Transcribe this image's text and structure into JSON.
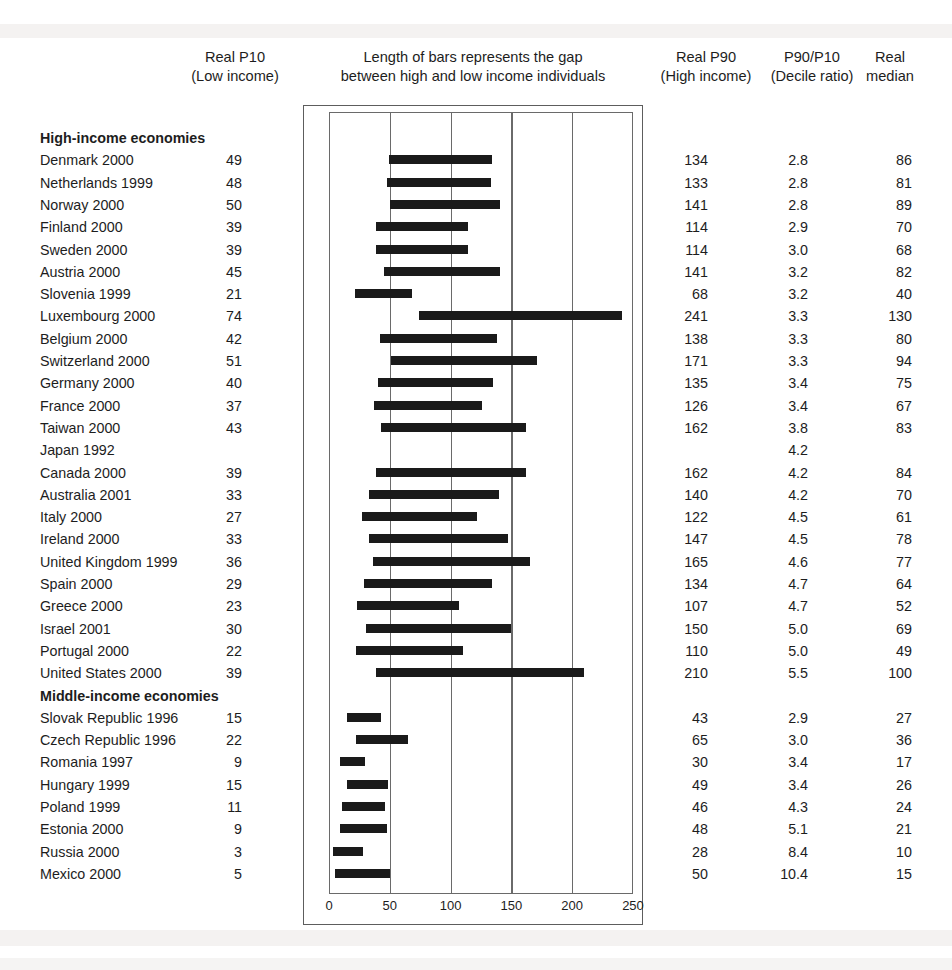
{
  "header": {
    "p10_line1": "Real P10",
    "p10_line2": "(Low income)",
    "chart_line1": "Length of bars represents the gap",
    "chart_line2": "between high and low income individuals",
    "p90_line1": "Real P90",
    "p90_line2": "(High income)",
    "ratio_line1": "P90/P10",
    "ratio_line2": "(Decile ratio)",
    "median_line1": "Real",
    "median_line2": "median"
  },
  "chart_data": {
    "type": "bar",
    "orientation": "horizontal",
    "title": "Length of bars represents the gap between high and low income individuals",
    "xlabel": "",
    "ylabel": "",
    "xlim": [
      0,
      250
    ],
    "xticks": [
      0,
      50,
      100,
      150,
      200,
      250
    ],
    "gridlines": [
      50,
      100,
      150,
      200
    ],
    "grid": true,
    "legend": false,
    "bar_start_field": "p10",
    "bar_end_field": "p90",
    "columns": [
      "Country and year",
      "Real P10",
      "Real P90",
      "P90/P10",
      "Real median"
    ],
    "groups": [
      {
        "label": "High-income economies",
        "rows": [
          {
            "label": "Denmark 2000",
            "p10": 49,
            "p90": 134,
            "ratio": "2.8",
            "median": 86
          },
          {
            "label": "Netherlands 1999",
            "p10": 48,
            "p90": 133,
            "ratio": "2.8",
            "median": 81
          },
          {
            "label": "Norway 2000",
            "p10": 50,
            "p90": 141,
            "ratio": "2.8",
            "median": 89
          },
          {
            "label": "Finland 2000",
            "p10": 39,
            "p90": 114,
            "ratio": "2.9",
            "median": 70
          },
          {
            "label": "Sweden 2000",
            "p10": 39,
            "p90": 114,
            "ratio": "3.0",
            "median": 68
          },
          {
            "label": "Austria 2000",
            "p10": 45,
            "p90": 141,
            "ratio": "3.2",
            "median": 82
          },
          {
            "label": "Slovenia 1999",
            "p10": 21,
            "p90": 68,
            "ratio": "3.2",
            "median": 40
          },
          {
            "label": "Luxembourg 2000",
            "p10": 74,
            "p90": 241,
            "ratio": "3.3",
            "median": 130
          },
          {
            "label": "Belgium 2000",
            "p10": 42,
            "p90": 138,
            "ratio": "3.3",
            "median": 80
          },
          {
            "label": "Switzerland 2000",
            "p10": 51,
            "p90": 171,
            "ratio": "3.3",
            "median": 94
          },
          {
            "label": "Germany 2000",
            "p10": 40,
            "p90": 135,
            "ratio": "3.4",
            "median": 75
          },
          {
            "label": "France 2000",
            "p10": 37,
            "p90": 126,
            "ratio": "3.4",
            "median": 67
          },
          {
            "label": "Taiwan 2000",
            "p10": 43,
            "p90": 162,
            "ratio": "3.8",
            "median": 83
          },
          {
            "label": "Japan 1992",
            "p10": null,
            "p90": null,
            "ratio": "4.2",
            "median": null
          },
          {
            "label": "Canada 2000",
            "p10": 39,
            "p90": 162,
            "ratio": "4.2",
            "median": 84
          },
          {
            "label": "Australia 2001",
            "p10": 33,
            "p90": 140,
            "ratio": "4.2",
            "median": 70
          },
          {
            "label": "Italy 2000",
            "p10": 27,
            "p90": 122,
            "ratio": "4.5",
            "median": 61
          },
          {
            "label": "Ireland 2000",
            "p10": 33,
            "p90": 147,
            "ratio": "4.5",
            "median": 78
          },
          {
            "label": "United Kingdom 1999",
            "p10": 36,
            "p90": 165,
            "ratio": "4.6",
            "median": 77
          },
          {
            "label": "Spain 2000",
            "p10": 29,
            "p90": 134,
            "ratio": "4.7",
            "median": 64
          },
          {
            "label": "Greece 2000",
            "p10": 23,
            "p90": 107,
            "ratio": "4.7",
            "median": 52
          },
          {
            "label": "Israel 2001",
            "p10": 30,
            "p90": 150,
            "ratio": "5.0",
            "median": 69
          },
          {
            "label": "Portugal 2000",
            "p10": 22,
            "p90": 110,
            "ratio": "5.0",
            "median": 49
          },
          {
            "label": "United States 2000",
            "p10": 39,
            "p90": 210,
            "ratio": "5.5",
            "median": 100
          }
        ]
      },
      {
        "label": "Middle-income economies",
        "rows": [
          {
            "label": "Slovak Republic 1996",
            "p10": 15,
            "p90": 43,
            "ratio": "2.9",
            "median": 27
          },
          {
            "label": "Czech Republic 1996",
            "p10": 22,
            "p90": 65,
            "ratio": "3.0",
            "median": 36
          },
          {
            "label": "Romania 1997",
            "p10": 9,
            "p90": 30,
            "ratio": "3.4",
            "median": 17
          },
          {
            "label": "Hungary 1999",
            "p10": 15,
            "p90": 49,
            "ratio": "3.4",
            "median": 26
          },
          {
            "label": "Poland 1999",
            "p10": 11,
            "p90": 46,
            "ratio": "4.3",
            "median": 24
          },
          {
            "label": "Estonia 2000",
            "p10": 9,
            "p90": 48,
            "ratio": "5.1",
            "median": 21
          },
          {
            "label": "Russia 2000",
            "p10": 3,
            "p90": 28,
            "ratio": "8.4",
            "median": 10
          },
          {
            "label": "Mexico 2000",
            "p10": 5,
            "p90": 50,
            "ratio": "10.4",
            "median": 15
          }
        ]
      }
    ]
  },
  "colors": {
    "bar": "#1a1a1a",
    "frame": "#5d5d5d",
    "text": "#1d1d1d",
    "background": "#ffffff"
  }
}
